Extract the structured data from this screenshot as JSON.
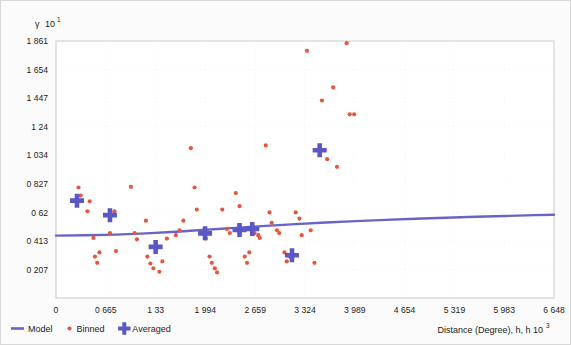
{
  "chart_data": {
    "type": "scatter",
    "title": "",
    "xlabel": "Distance (Degree), h",
    "xlabel_exponent": "3",
    "ylabel": "γ",
    "ylabel_exponent": "1",
    "xlim": [
      0,
      6.648
    ],
    "ylim": [
      0,
      1.861
    ],
    "grid": true,
    "legend_position": "bottom-left",
    "xticks": [
      "0",
      "0 665",
      "1 33",
      "1 994",
      "2 659",
      "3 324",
      "3 989",
      "4 654",
      "5 319",
      "5 983",
      "6 648"
    ],
    "xtick_values": [
      0,
      0.665,
      1.33,
      1.994,
      2.659,
      3.324,
      3.989,
      4.654,
      5.319,
      5.983,
      6.648
    ],
    "yticks": [
      "0 207",
      "0 413",
      "0 62",
      "0 827",
      "1 034",
      "1 24",
      "1 447",
      "1 654",
      "1 861"
    ],
    "ytick_values": [
      0.207,
      0.413,
      0.62,
      0.827,
      1.034,
      1.24,
      1.447,
      1.654,
      1.861
    ],
    "series": [
      {
        "name": "Model",
        "type": "line",
        "color": "#6a63c8",
        "points": [
          [
            0.0,
            0.452
          ],
          [
            0.4,
            0.454
          ],
          [
            0.8,
            0.459
          ],
          [
            1.2,
            0.468
          ],
          [
            1.6,
            0.48
          ],
          [
            2.0,
            0.494
          ],
          [
            2.4,
            0.508
          ],
          [
            2.8,
            0.522
          ],
          [
            3.2,
            0.535
          ],
          [
            3.6,
            0.547
          ],
          [
            4.0,
            0.557
          ],
          [
            4.4,
            0.566
          ],
          [
            4.8,
            0.574
          ],
          [
            5.2,
            0.581
          ],
          [
            5.6,
            0.588
          ],
          [
            6.0,
            0.594
          ],
          [
            6.4,
            0.6
          ],
          [
            6.648,
            0.603
          ]
        ]
      },
      {
        "name": "Binned",
        "type": "scatter",
        "color": "#e6573f",
        "points": [
          [
            0.3,
            0.8
          ],
          [
            0.33,
            0.742
          ],
          [
            0.42,
            0.628
          ],
          [
            0.45,
            0.7
          ],
          [
            0.5,
            0.435
          ],
          [
            0.52,
            0.3
          ],
          [
            0.55,
            0.255
          ],
          [
            0.58,
            0.33
          ],
          [
            0.72,
            0.47
          ],
          [
            0.78,
            0.628
          ],
          [
            0.8,
            0.34
          ],
          [
            1.0,
            0.805
          ],
          [
            1.05,
            0.47
          ],
          [
            1.08,
            0.425
          ],
          [
            1.2,
            0.56
          ],
          [
            1.22,
            0.3
          ],
          [
            1.26,
            0.25
          ],
          [
            1.3,
            0.215
          ],
          [
            1.38,
            0.19
          ],
          [
            1.42,
            0.265
          ],
          [
            1.48,
            0.43
          ],
          [
            1.6,
            0.455
          ],
          [
            1.65,
            0.49
          ],
          [
            1.7,
            0.56
          ],
          [
            1.8,
            1.085
          ],
          [
            1.85,
            0.8
          ],
          [
            1.88,
            0.64
          ],
          [
            1.95,
            0.47
          ],
          [
            1.98,
            0.46
          ],
          [
            2.0,
            0.43
          ],
          [
            2.05,
            0.3
          ],
          [
            2.08,
            0.255
          ],
          [
            2.12,
            0.215
          ],
          [
            2.15,
            0.185
          ],
          [
            2.22,
            0.64
          ],
          [
            2.28,
            0.5
          ],
          [
            2.32,
            0.47
          ],
          [
            2.4,
            0.76
          ],
          [
            2.45,
            0.665
          ],
          [
            2.52,
            0.3
          ],
          [
            2.55,
            0.255
          ],
          [
            2.58,
            0.33
          ],
          [
            2.65,
            0.47
          ],
          [
            2.7,
            0.455
          ],
          [
            2.72,
            0.435
          ],
          [
            2.8,
            1.105
          ],
          [
            2.85,
            0.62
          ],
          [
            2.88,
            0.545
          ],
          [
            2.95,
            0.49
          ],
          [
            2.98,
            0.47
          ],
          [
            3.05,
            0.33
          ],
          [
            3.08,
            0.265
          ],
          [
            3.12,
            0.3
          ],
          [
            3.2,
            0.62
          ],
          [
            3.25,
            0.575
          ],
          [
            3.28,
            0.455
          ],
          [
            3.35,
            1.79
          ],
          [
            3.4,
            0.49
          ],
          [
            3.45,
            0.255
          ],
          [
            3.55,
            1.43
          ],
          [
            3.58,
            1.07
          ],
          [
            3.62,
            1.005
          ],
          [
            3.7,
            1.525
          ],
          [
            3.75,
            0.95
          ],
          [
            3.88,
            1.845
          ],
          [
            3.92,
            1.33
          ],
          [
            3.98,
            1.33
          ]
        ]
      },
      {
        "name": "Averaged",
        "type": "scatter-plus",
        "color": "#5b57c4",
        "points": [
          [
            0.28,
            0.705
          ],
          [
            0.72,
            0.6
          ],
          [
            1.33,
            0.37
          ],
          [
            1.99,
            0.468
          ],
          [
            2.45,
            0.492
          ],
          [
            2.62,
            0.5
          ],
          [
            3.15,
            0.31
          ],
          [
            3.52,
            1.07
          ]
        ]
      }
    ]
  },
  "legend": {
    "items": [
      {
        "label": "Model",
        "marker": "line",
        "color": "#6a63c8"
      },
      {
        "label": "Binned",
        "marker": "dot",
        "color": "#e6573f"
      },
      {
        "label": "Averaged",
        "marker": "plus",
        "color": "#5b57c4"
      }
    ]
  }
}
